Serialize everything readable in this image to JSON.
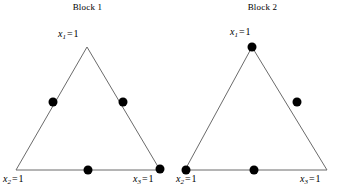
{
  "figure": {
    "background_color": "#ffffff",
    "line_color": "#6b6b6b",
    "dot_color": "#000000",
    "text_color": "#000000"
  },
  "blocks": [
    {
      "id": "block-1",
      "title": "Block 1",
      "vertex_labels": {
        "top": {
          "var": "x",
          "sub": "1",
          "eq": "=",
          "value": "1",
          "full": "x1 = 1"
        },
        "bottom_left": {
          "var": "x",
          "sub": "2",
          "eq": "=",
          "value": "1",
          "full": "x2 = 1"
        },
        "bottom_right": {
          "var": "x",
          "sub": "3",
          "eq": "=",
          "value": "1",
          "full": "x3 = 1"
        }
      },
      "triangle": {
        "apex": [
          87,
          47
        ],
        "bottom_left": [
          16,
          170
        ],
        "bottom_right": [
          160,
          170
        ]
      },
      "points": [
        {
          "name": "left-edge-midpoint",
          "x": 53,
          "y": 102
        },
        {
          "name": "right-edge-midpoint",
          "x": 123,
          "y": 102
        },
        {
          "name": "bottom-edge-midpoint",
          "x": 88,
          "y": 170
        },
        {
          "name": "bottom-right-vertex",
          "x": 160,
          "y": 169
        }
      ]
    },
    {
      "id": "block-2",
      "title": "Block 2",
      "vertex_labels": {
        "top": {
          "var": "x",
          "sub": "1",
          "eq": "=",
          "value": "1",
          "full": "x1 = 1"
        },
        "bottom_left": {
          "var": "x",
          "sub": "2",
          "eq": "=",
          "value": "1",
          "full": "x2 = 1"
        },
        "bottom_right": {
          "var": "x",
          "sub": "3",
          "eq": "=",
          "value": "1",
          "full": "x3 = 1"
        }
      },
      "triangle": {
        "apex": [
          77,
          47
        ],
        "bottom_left": [
          10,
          170
        ],
        "bottom_right": [
          152,
          170
        ]
      },
      "points": [
        {
          "name": "apex-vertex",
          "x": 77,
          "y": 47
        },
        {
          "name": "right-edge-point",
          "x": 122,
          "y": 102
        },
        {
          "name": "bottom-left-vertex",
          "x": 11,
          "y": 170
        },
        {
          "name": "bottom-edge-midpoint",
          "x": 79,
          "y": 170
        }
      ]
    }
  ]
}
